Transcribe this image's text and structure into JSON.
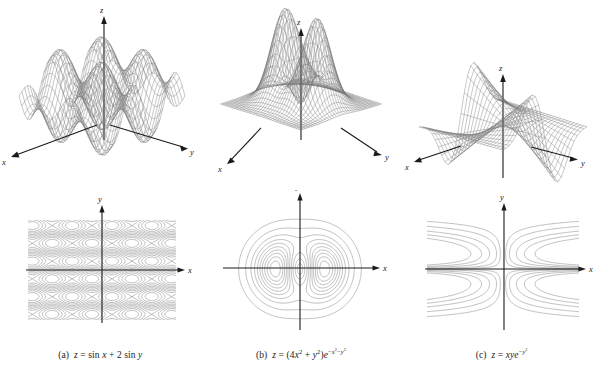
{
  "figure": {
    "title": "",
    "background_color": "#ffffff",
    "mesh_color": "#6d6d6d",
    "axis_color": "#1a1a1a",
    "contour_color": "#8a8a8a",
    "panel_count": 3
  },
  "panels": [
    {
      "id": "a",
      "label": "(a)",
      "caption_prefix": "(a)",
      "equation_plain": "z = sin x + 2 sin y",
      "surface": {
        "axis_labels": {
          "x": "x",
          "y": "y",
          "z": "z"
        },
        "description": "wavy doubly-periodic sinusoidal surface"
      },
      "contour": {
        "axis_labels": {
          "x": "x",
          "y": "y"
        },
        "description": "periodic lattice of closed oval level curves"
      }
    },
    {
      "id": "b",
      "label": "(b)",
      "caption_prefix": "(b)",
      "equation_plain": "z = (4x² + y²)e^(−x²−y²)",
      "surface": {
        "axis_labels": {
          "x": "x",
          "y": "y",
          "z": "z"
        },
        "description": "two tall peaks rising from a flat plane"
      },
      "contour": {
        "axis_labels": {
          "x": "x",
          "y": "y"
        },
        "description": "nested concentric ovals around two lobes"
      }
    },
    {
      "id": "c",
      "label": "(c)",
      "caption_prefix": "(c)",
      "equation_plain": "z = xye^(−y²)",
      "surface": {
        "axis_labels": {
          "x": "x",
          "y": "y",
          "z": "z"
        },
        "description": "twisted saddle-like surface with ridges and troughs"
      },
      "contour": {
        "axis_labels": {
          "x": "x",
          "y": "y"
        },
        "description": "open hyperbola-like curves opening away from the y-axis"
      }
    }
  ],
  "chart_data": {
    "type": "line",
    "title": "",
    "xlabel": "x",
    "ylabel": "y",
    "charts": [
      {
        "id": "a",
        "kind": "surface-and-contour",
        "function": "z = sin x + 2 sin y",
        "xlim": [
          -6.283,
          6.283
        ],
        "ylim": [
          -6.283,
          6.283
        ],
        "zlim": [
          -3,
          3
        ],
        "axis_labels": [
          "x",
          "y",
          "z"
        ],
        "grid": false,
        "legend": "none",
        "contour_levels": [
          -2.5,
          -2,
          -1.5,
          -1,
          -0.5,
          0,
          0.5,
          1,
          1.5,
          2,
          2.5
        ]
      },
      {
        "id": "b",
        "kind": "surface-and-contour",
        "function": "z = (4x^2 + y^2)e^(-x^2-y^2)",
        "xlim": [
          -2.5,
          2.5
        ],
        "ylim": [
          -2.5,
          2.5
        ],
        "zlim": [
          0,
          1.5
        ],
        "axis_labels": [
          "x",
          "y",
          "z"
        ],
        "grid": false,
        "legend": "none",
        "contour_levels": [
          0.05,
          0.15,
          0.3,
          0.45,
          0.6,
          0.75,
          0.9,
          1.05,
          1.2,
          1.35
        ]
      },
      {
        "id": "c",
        "kind": "surface-and-contour",
        "function": "z = xye^(-y^2)",
        "xlim": [
          -2.5,
          2.5
        ],
        "ylim": [
          -2.5,
          2.5
        ],
        "zlim": [
          -1,
          1
        ],
        "axis_labels": [
          "x",
          "y",
          "z"
        ],
        "grid": false,
        "legend": "none",
        "contour_levels": [
          -0.6,
          -0.4,
          -0.25,
          -0.12,
          -0.05,
          0.05,
          0.12,
          0.25,
          0.4,
          0.6
        ]
      }
    ]
  }
}
